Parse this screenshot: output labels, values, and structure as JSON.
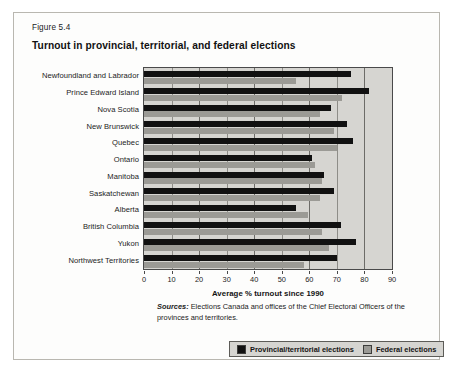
{
  "figure": {
    "number": "Figure 5.4",
    "title": "Turnout in provincial, territorial, and federal elections",
    "source_word": "Sources:",
    "source_text": " Elections Canada and offices of the Chief Electoral Officers of the provinces and territories."
  },
  "legend": {
    "items": [
      {
        "label": "Provincial/territorial elections",
        "color": "#111111",
        "icon": "square-swatch-dark"
      },
      {
        "label": "Federal elections",
        "color": "#9b9a95",
        "icon": "square-swatch-grey"
      }
    ]
  },
  "colors": {
    "provincial": "#111111",
    "federal": "#9b9a95",
    "plot_background": "#d6d5d1",
    "gridline": "#8e8d88",
    "axis": "#4a4a4a",
    "card_background": "#fdfdfc",
    "card_border": "#b9b7b0"
  },
  "chart_data": {
    "type": "bar",
    "orientation": "horizontal",
    "title": "Turnout in provincial, territorial, and federal elections",
    "xlabel": "Average % turnout since 1990",
    "ylabel": "",
    "xlim": [
      0,
      90
    ],
    "xticks": [
      0,
      10,
      20,
      30,
      40,
      50,
      60,
      70,
      80,
      90
    ],
    "grid": true,
    "grid_axis": "x",
    "legend_position": "bottom-right",
    "categories": [
      "Newfoundland and Labrador",
      "Prince Edward Island",
      "Nova Scotia",
      "New Brunswick",
      "Quebec",
      "Ontario",
      "Manitoba",
      "Saskatchewan",
      "Alberta",
      "British Columbia",
      "Yukon",
      "Northwest Territories"
    ],
    "series": [
      {
        "name": "Provincial/territorial elections",
        "color": "#111111",
        "values": [
          75,
          81.5,
          68,
          73.5,
          76,
          61,
          65.5,
          69,
          55,
          71.5,
          77,
          70
        ]
      },
      {
        "name": "Federal elections",
        "color": "#9b9a95",
        "values": [
          55,
          72,
          64,
          69,
          70,
          62,
          64.5,
          64,
          59.5,
          64.5,
          67,
          58
        ]
      }
    ]
  }
}
